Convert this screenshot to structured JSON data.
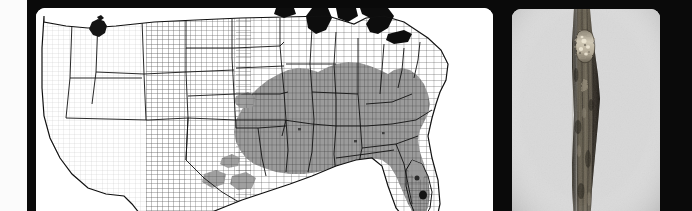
{
  "figure": {
    "background_color": "#0a0a0a",
    "panel_count": 2,
    "panels": [
      {
        "id": "distribution-map",
        "kind": "county-level choropleth map",
        "region": "United States (contiguous, conterminous)",
        "background_color": "#ffffff"
      },
      {
        "id": "specimen-photo",
        "kind": "photograph",
        "subject": "woody twig / stem with canker lesion",
        "background_color": "#d9d9d9"
      }
    ]
  },
  "map": {
    "title": "",
    "projection": "albers-equal-area",
    "outline_color": "#1a1a1a",
    "county_line_color": "#3a3a3a",
    "state_line_color": "#111111",
    "water_color": "#0d0d0d",
    "legend": {
      "visible": false,
      "classes": [
        {
          "label": "Present (shaded range)",
          "color": "#9a9a9a"
        },
        {
          "label": "Isolated record (county)",
          "color": "#141414"
        },
        {
          "label": "Absent",
          "color": "#ffffff"
        }
      ]
    },
    "features": {
      "shaded_range_description": "Contiguous shaded range covering the south-central and southeastern United States, extending from eastern Texas and Oklahoma north through Missouri and southern Illinois/Indiana, east through Kentucky, Tennessee, the Carolinas and Virginia, and south through Arkansas, Louisiana, Mississippi, Alabama, Georgia and into northern and central Florida.",
      "isolated_records": [
        {
          "name": "northwest-county-record",
          "region": "Pacific Northwest / Northern Rockies"
        },
        {
          "name": "south-florida-county-record",
          "region": "southern Florida peninsula"
        },
        {
          "name": "central-florida-county-record",
          "region": "central Florida peninsula"
        }
      ],
      "water_bodies": [
        "Great Lakes",
        "Lake Michigan",
        "Lake Superior",
        "Lake Huron",
        "Lake Erie",
        "Lake Ontario"
      ]
    }
  },
  "photo": {
    "caption": "",
    "specimen": "twig",
    "orientation": "vertical",
    "background_color": "#d9d9d9",
    "bark_color": "#4a443c",
    "lesion": {
      "name": "canker-lesion",
      "position": "upper portion of twig",
      "color": "#c9c0ae",
      "description": "Pale, roughened sunken canker with exposed lighter tissue on the bark surface"
    },
    "scale_bar": {
      "visible": false,
      "label": ""
    }
  }
}
